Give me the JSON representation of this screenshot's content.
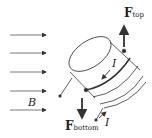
{
  "diagram": {
    "field_label": "B",
    "force_top": {
      "symbol": "F",
      "subscript": "top"
    },
    "force_bottom": {
      "symbol": "F",
      "subscript": "bottom"
    },
    "current_label_top": "I",
    "current_label_bottom": "I",
    "field_arrow_count": 5,
    "colors": {
      "stroke": "#333333",
      "background": "#ffffff"
    }
  }
}
